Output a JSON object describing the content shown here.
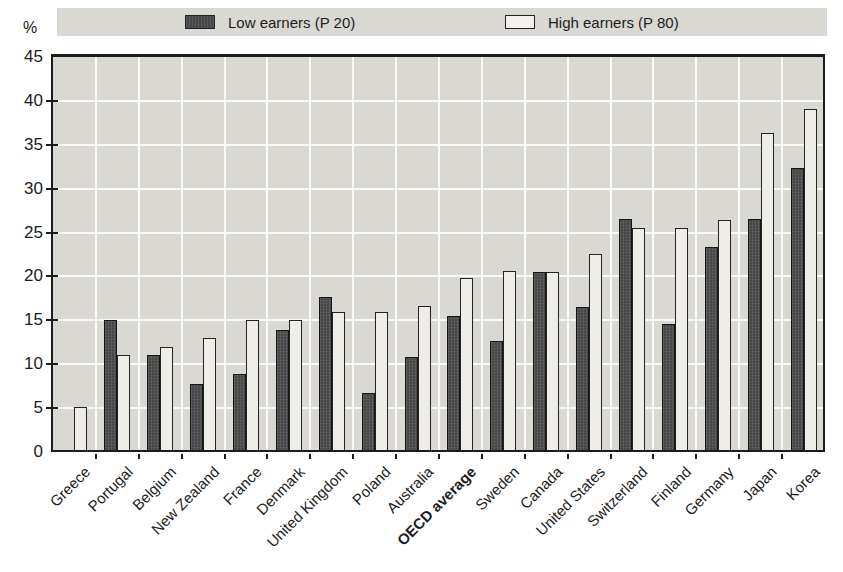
{
  "unit_label": "%",
  "legend": {
    "low_label": "Low earners (P 20)",
    "high_label": "High earners (P 80)"
  },
  "colors": {
    "low_bar": "#474747",
    "high_bar": "#efede8",
    "plot_background": "#d9d8d3",
    "gridline": "#ffffff",
    "axis": "#1c1c1c"
  },
  "chart_data": {
    "type": "bar",
    "title": "",
    "ylabel": "%",
    "xlabel": "",
    "ylim": [
      0,
      45
    ],
    "ytick_step": 5,
    "grid": true,
    "legend_position": "top",
    "emphasized_category": "OECD average",
    "categories": [
      "Greece",
      "Portugal",
      "Belgium",
      "New Zealand",
      "France",
      "Denmark",
      "United Kingdom",
      "Poland",
      "Australia",
      "OECD average",
      "Sweden",
      "Canada",
      "United States",
      "Switzerland",
      "Finland",
      "Germany",
      "Japan",
      "Korea"
    ],
    "series": [
      {
        "name": "Low earners (P 20)",
        "values": [
          0,
          15.0,
          11.0,
          7.8,
          8.9,
          13.9,
          17.7,
          6.7,
          10.8,
          15.5,
          12.7,
          20.5,
          16.5,
          26.6,
          14.6,
          23.4,
          26.5,
          32.3
        ]
      },
      {
        "name": "High earners (P 80)",
        "values": [
          5.1,
          11.0,
          12.0,
          13.0,
          15.0,
          15.0,
          15.9,
          15.9,
          16.6,
          19.8,
          20.6,
          20.5,
          22.6,
          25.5,
          25.5,
          26.4,
          36.4,
          39.1
        ]
      }
    ]
  }
}
